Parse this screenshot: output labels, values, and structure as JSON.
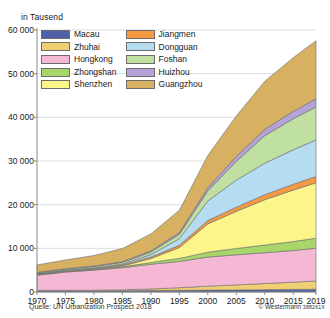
{
  "chart_data": {
    "type": "area",
    "title": "",
    "ylabel": "in Tausend",
    "xlabel": "",
    "stacked": true,
    "grid": true,
    "legend_position": "top-left-inside",
    "xlim": [
      1970,
      2019
    ],
    "ylim": [
      0,
      60000
    ],
    "ytick_values": [
      0,
      10000,
      20000,
      30000,
      40000,
      50000,
      60000
    ],
    "ytick_labels": [
      "0",
      "10 000",
      "20 000",
      "30 000",
      "40 000",
      "50 000",
      "60 000"
    ],
    "xtick_values": [
      1970,
      1975,
      1980,
      1985,
      1990,
      1995,
      2000,
      2005,
      2010,
      2015,
      2019
    ],
    "xtick_labels": [
      "1970",
      "1975",
      "1980",
      "1985",
      "1990",
      "1995",
      "2000",
      "2005",
      "2010",
      "2015",
      "2019"
    ],
    "x": [
      1970,
      1975,
      1980,
      1985,
      1990,
      1995,
      2000,
      2005,
      2010,
      2015,
      2019
    ],
    "series": [
      {
        "name": "Macau",
        "color": "#4f5fa8",
        "values": [
          250,
          260,
          250,
          290,
          340,
          390,
          430,
          470,
          540,
          600,
          640
        ]
      },
      {
        "name": "Zhuhai",
        "color": "#f0cf72",
        "values": [
          120,
          140,
          160,
          200,
          350,
          600,
          900,
          1150,
          1400,
          1650,
          1890
        ]
      },
      {
        "name": "Hongkong",
        "color": "#f4b8d4",
        "values": [
          3470,
          4170,
          4600,
          5070,
          5670,
          6000,
          6670,
          6900,
          7050,
          7250,
          7490
        ]
      },
      {
        "name": "Zhongshan",
        "color": "#a8d66a",
        "values": [
          100,
          120,
          150,
          200,
          400,
          700,
          1100,
          1450,
          1750,
          2050,
          2290
        ]
      },
      {
        "name": "Shenzhen",
        "color": "#fcf58a",
        "values": [
          50,
          60,
          80,
          200,
          900,
          2500,
          6500,
          8500,
          10400,
          11800,
          12700
        ]
      },
      {
        "name": "Jiangmen",
        "color": "#f59a43",
        "values": [
          120,
          140,
          170,
          220,
          350,
          520,
          750,
          950,
          1150,
          1320,
          1450
        ]
      },
      {
        "name": "Dongguan",
        "color": "#b6dcf2",
        "values": [
          100,
          120,
          150,
          230,
          550,
          1500,
          4500,
          6200,
          7200,
          7900,
          8350
        ]
      },
      {
        "name": "Foshan",
        "color": "#bfe0a0",
        "values": [
          200,
          240,
          290,
          380,
          600,
          1000,
          2300,
          4300,
          6300,
          7100,
          7560
        ]
      },
      {
        "name": "Huizhou",
        "color": "#b3a3d6",
        "values": [
          80,
          95,
          110,
          150,
          250,
          400,
          700,
          1100,
          1450,
          1700,
          1860
        ]
      },
      {
        "name": "Guangzhou",
        "color": "#d7b062",
        "values": [
          1700,
          2000,
          2400,
          3000,
          3900,
          5100,
          7400,
          9300,
          11000,
          12300,
          13300
        ]
      }
    ],
    "totals": [
      6190,
      7345,
      8360,
      9940,
      13310,
      18710,
      31250,
      40320,
      48240,
      53670,
      57530
    ],
    "annotations": {
      "source": "Quelle: UN Urbanization Prospect 2018",
      "credit": "© Westermann",
      "credit_code": "388261X"
    }
  },
  "legend": {
    "items": [
      {
        "label": "Macau",
        "color": "#4f5fa8"
      },
      {
        "label": "Jiangmen",
        "color": "#f59a43"
      },
      {
        "label": "Zhuhai",
        "color": "#f0cf72"
      },
      {
        "label": "Dongguan",
        "color": "#b6dcf2"
      },
      {
        "label": "Hongkong",
        "color": "#f4b8d4"
      },
      {
        "label": "Foshan",
        "color": "#bfe0a0"
      },
      {
        "label": "Zhongshan",
        "color": "#a8d66a"
      },
      {
        "label": "Huizhou",
        "color": "#b3a3d6"
      },
      {
        "label": "Shenzhen",
        "color": "#fcf58a"
      },
      {
        "label": "Guangzhou",
        "color": "#d7b062"
      }
    ]
  },
  "colors": {
    "axis": "#8a8a8a",
    "grid": "#cfcfcf",
    "text": "#1a1a1a",
    "band_stroke": "#6d6d6d",
    "background": "#ffffff"
  }
}
